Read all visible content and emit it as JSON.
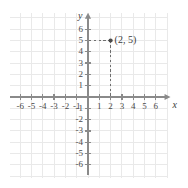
{
  "chart_data": {
    "type": "scatter",
    "title": "",
    "xlabel": "x",
    "ylabel": "y",
    "xlim": [
      -7,
      7
    ],
    "ylim": [
      -7,
      7
    ],
    "grid": true,
    "legend": false,
    "x_ticks": [
      -6,
      -5,
      -4,
      -3,
      -2,
      -1,
      1,
      2,
      3,
      4,
      5,
      6
    ],
    "y_ticks": [
      6,
      5,
      4,
      3,
      2,
      1,
      -1,
      -2,
      -3,
      -4,
      -5,
      -6
    ],
    "x_tick_labels": [
      "-6",
      "-5",
      "-4",
      "-3",
      "-2",
      "-1",
      "1",
      "2",
      "3",
      "4",
      "5",
      "6"
    ],
    "y_tick_labels": [
      "6",
      "5",
      "4",
      "3",
      "2",
      "1",
      "-1",
      "-2",
      "-3",
      "-4",
      "-5",
      "-6"
    ],
    "points": [
      {
        "x": 2,
        "y": 5,
        "label": "(2, 5)",
        "guides": "dashed"
      }
    ],
    "origin_label": ""
  },
  "axes": {
    "x_axis_name": "x",
    "y_axis_name": "y"
  },
  "colors": {
    "axis": "#8a8a8a",
    "grid": "#e9e9e9",
    "tick_text": "#4a4a4a",
    "point": "#4a4a4a",
    "dash": "#6e6e6e",
    "background": "#ffffff"
  }
}
